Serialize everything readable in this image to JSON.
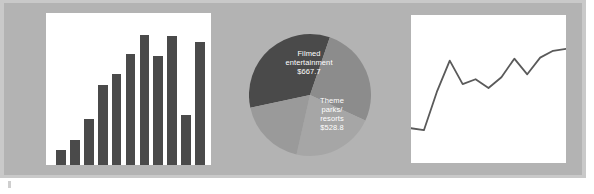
{
  "figure": {
    "background_color": "#b3b3b3",
    "rim_color": "#c9c9c9",
    "panel_color": "#ffffff"
  },
  "chart_data": [
    {
      "type": "bar",
      "title": "",
      "xlabel": "",
      "ylabel": "",
      "categories": [
        "1",
        "2",
        "3",
        "4",
        "5",
        "6",
        "7",
        "8",
        "9",
        "10",
        "11"
      ],
      "values": [
        11,
        18,
        33,
        57,
        65,
        79,
        93,
        78,
        92,
        36,
        88
      ],
      "ylim": [
        0,
        100
      ],
      "grid": false,
      "legend": "none",
      "bar_color": "#4a4a4a"
    },
    {
      "type": "pie",
      "title": "",
      "legend": "labels-inside",
      "slices": [
        {
          "label": "Filmed entertainment",
          "value_label": "$667.7",
          "value": 667.7,
          "color": "#4a4a4a",
          "label_color": "#ffffff"
        },
        {
          "label": "Theme parks/ resorts",
          "value_label": "$528.8",
          "value": 528.8,
          "color": "#8c8c8c",
          "label_color": "#ffffff"
        },
        {
          "label": "",
          "value_label": "",
          "value": 430.0,
          "color": "#a6a6a6",
          "label_color": "#ffffff"
        },
        {
          "label": "",
          "value_label": "",
          "value": 360.0,
          "color": "#9a9a9a",
          "label_color": "#ffffff"
        }
      ]
    },
    {
      "type": "line",
      "title": "",
      "xlabel": "",
      "ylabel": "",
      "x": [
        0,
        1,
        2,
        3,
        4,
        5,
        6,
        7,
        8,
        9,
        10,
        11,
        12
      ],
      "values": [
        11,
        9,
        48,
        80,
        56,
        61,
        52,
        63,
        82,
        66,
        83,
        90,
        92
      ],
      "ylim": [
        0,
        100
      ],
      "grid": false,
      "legend": "none",
      "line_color": "#5a5a5a"
    }
  ],
  "pie_labels": {
    "filmed": {
      "line1": "Filmed",
      "line2": "entertainment",
      "value": "$667.7"
    },
    "theme": {
      "line1": "Theme",
      "line2": "parks/",
      "line3": "resorts",
      "value": "$528.8"
    }
  }
}
